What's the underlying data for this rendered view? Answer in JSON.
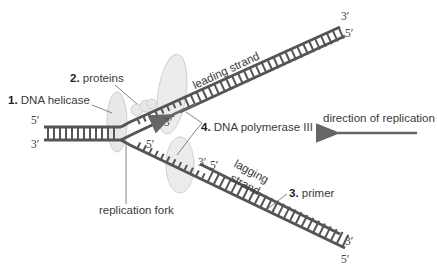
{
  "diagram": {
    "colors": {
      "strand": "#555555",
      "enzyme_fill": "#e6e6e6",
      "enzyme_stroke": "#c9c9c9",
      "arrow": "#666666",
      "leader_line": "#666666"
    },
    "labels": {
      "helicase_num": "1.",
      "helicase_text": "DNA helicase",
      "proteins_num": "2.",
      "proteins_text": "proteins",
      "primer_num": "3.",
      "primer_text": "primer",
      "polymerase_num": "4.",
      "polymerase_text": "DNA polymerase III",
      "leading_strand": "leading strand",
      "lagging_strand_1": "lagging",
      "lagging_strand_2": "strand",
      "replication_fork": "replication fork",
      "direction": "direction of replication"
    },
    "strand_ends": {
      "parent_top": "5′",
      "parent_bottom": "3′",
      "upper_arm_top": "3′",
      "upper_arm_bottom": "5′",
      "lower_arm_top": "3′",
      "lower_arm_bottom": "5′",
      "leading_new_3": "3′",
      "lagging_template_5": "5′",
      "okazaki_3": "3′",
      "okazaki_5": "5′"
    }
  }
}
